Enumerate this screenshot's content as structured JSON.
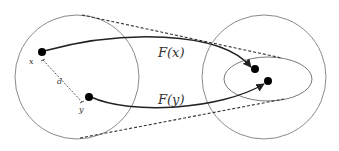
{
  "diagram": {
    "title": "",
    "labels": {
      "point_x": "x",
      "point_y": "y",
      "distance": "d",
      "map_x": "F(x)",
      "map_y": "F(y)"
    },
    "nodes": [
      {
        "id": "x",
        "label": "x",
        "cx": 42,
        "cy": 52
      },
      {
        "id": "y",
        "label": "y",
        "cx": 89,
        "cy": 97
      },
      {
        "id": "Fx",
        "label": "F(x)",
        "cx": 255,
        "cy": 69
      },
      {
        "id": "Fy",
        "label": "F(y)",
        "cx": 268,
        "cy": 81
      }
    ],
    "regions": [
      {
        "id": "domain-ball",
        "shape": "circle",
        "cx": 77,
        "cy": 77,
        "r": 62
      },
      {
        "id": "codomain-ball",
        "shape": "circle",
        "cx": 264,
        "cy": 77,
        "r": 62
      },
      {
        "id": "image-ellipse",
        "shape": "ellipse",
        "cx": 268,
        "cy": 79,
        "rx": 44,
        "ry": 22
      }
    ],
    "edges": [
      {
        "from": "x",
        "to": "Fx",
        "label": "F(x)",
        "style": "solid-arrow"
      },
      {
        "from": "y",
        "to": "Fy",
        "label": "F(y)",
        "style": "solid-arrow"
      },
      {
        "from": "x",
        "to": "y",
        "label": "d",
        "style": "dashed-measure"
      }
    ],
    "colors": {
      "circle": "#8a8a8a",
      "ellipse": "#7a7a7a",
      "arrow": "#222222",
      "dot": "#000000",
      "text": "#333333"
    }
  }
}
